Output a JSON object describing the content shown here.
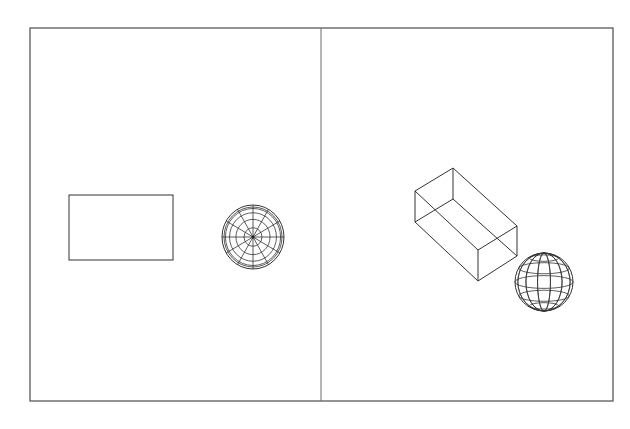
{
  "drawing": {
    "background": "#ffffff",
    "line_color": "#333333",
    "frame_color": "#5a5a5a",
    "frame": {
      "x1": 30,
      "y1": 28,
      "x2": 613,
      "y2": 401
    },
    "divider_x": 321
  },
  "viewports": [
    {
      "id": "plan-view",
      "objects": [
        {
          "type": "rectangle",
          "name": "box-top-view",
          "x": 69,
          "y": 195,
          "width": 104,
          "height": 65
        },
        {
          "type": "sphere-plan",
          "name": "sphere-top-view",
          "cx": 253,
          "cy": 237,
          "rx": 31,
          "ry": 32,
          "rings": 4,
          "spokes": 12
        }
      ]
    },
    {
      "id": "isometric-view",
      "objects": [
        {
          "type": "box-iso",
          "name": "box-isometric",
          "vertices": {
            "top_back": [
              453,
              168
            ],
            "top_left": [
              415,
              191
            ],
            "top_right": [
              517,
              226
            ],
            "top_front": [
              478,
              250
            ],
            "bottom_left": [
              415,
              222
            ],
            "bottom_right": [
              517,
              256
            ],
            "bottom_front": [
              478,
              281
            ],
            "bottom_back": [
              453,
              199
            ]
          }
        },
        {
          "type": "sphere-iso",
          "name": "sphere-isometric",
          "cx": 544,
          "cy": 282,
          "r": 29,
          "latitudes": 5,
          "longitudes": 6
        }
      ]
    }
  ]
}
